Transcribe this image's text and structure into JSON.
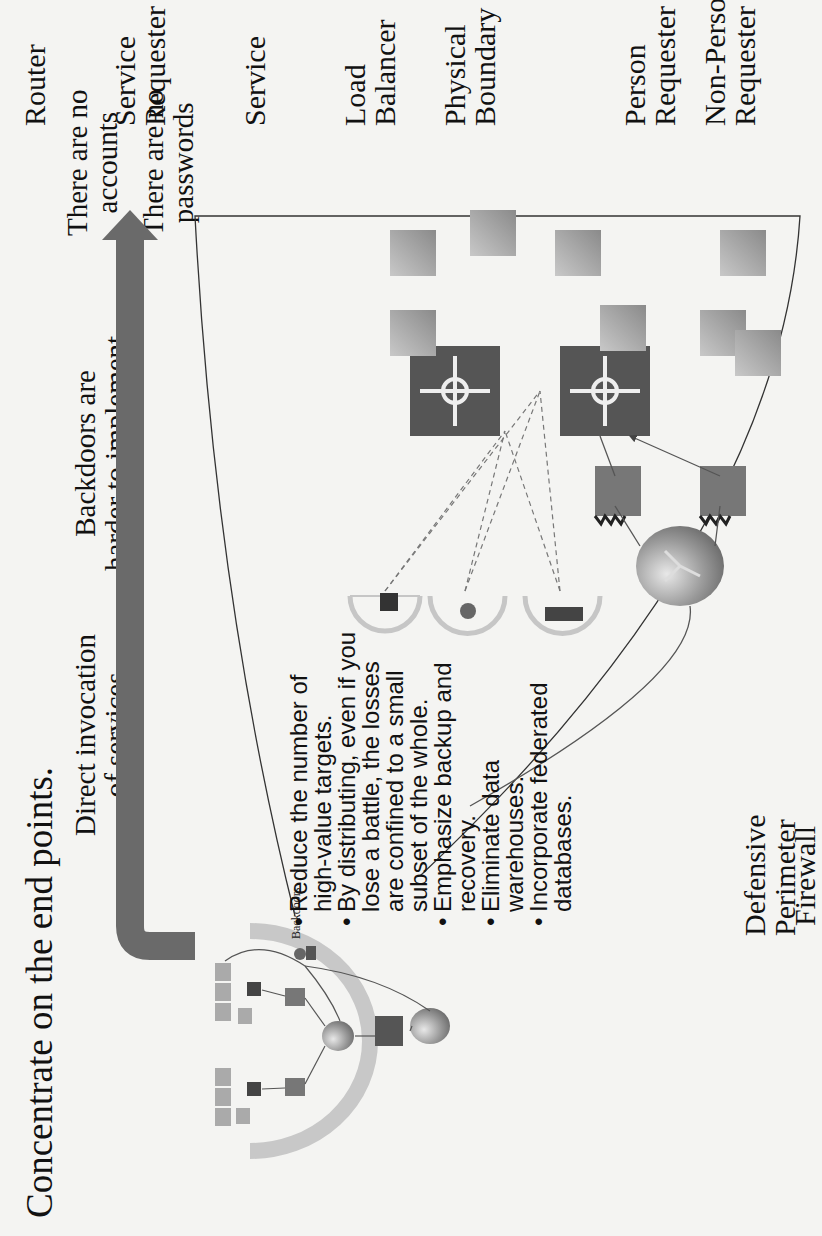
{
  "title": "Concentrate on the end points.",
  "callouts": {
    "direct_invocation": [
      "Direct invocation",
      "of services"
    ],
    "backdoors": [
      "Backdoors are",
      "harder to implement"
    ],
    "no_accounts": [
      "There are no",
      "accounts"
    ],
    "no_passwords": [
      "There are no",
      "passwords"
    ]
  },
  "inset": {
    "backdoors_label": "Backdoors"
  },
  "bullets": [
    "Reduce the number of high-value targets.",
    "By distributing, even if you lose a battle, the losses are confined to a small subset of the whole.",
    "Emphasize backup and recovery.",
    "Eliminate data warehouses.",
    "Incorporate federated databases."
  ],
  "legend": {
    "router": "Router",
    "service_requester": [
      "Service",
      "Requester"
    ],
    "service": "Service",
    "load_balancer": [
      "Load",
      "Balancer"
    ],
    "physical_boundary": [
      "Physical",
      "Boundary"
    ],
    "person_requester": [
      "Person",
      "Requester"
    ],
    "non_person_requester": [
      "Non-Person",
      "Requester"
    ],
    "defensive_perimeter": [
      "Defensive",
      "Perimeter"
    ],
    "firewall": "Firewall"
  },
  "colors": {
    "background": "#f4f4f2",
    "arrow": "#6a6a6a",
    "perimeter": "#bdbdbd",
    "load_balancer": "#555555",
    "service_box": "#9a9a9a",
    "line": "#333333"
  }
}
